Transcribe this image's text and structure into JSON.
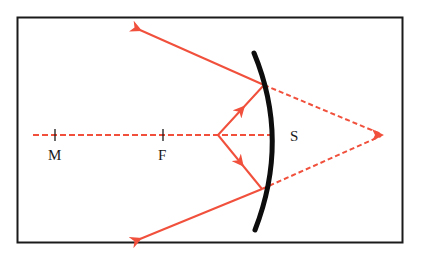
{
  "diagram": {
    "type": "convex-mirror-ray-diagram",
    "colors": {
      "frame": "#1a1a1a",
      "ray": "#f0503c",
      "mirror": "#0d0d0d",
      "label": "#1a1a1a",
      "background": "#ffffff"
    },
    "labels": {
      "M": "M",
      "F": "F",
      "S": "S"
    },
    "points": {
      "M": {
        "x": 55,
        "y": 135
      },
      "F": {
        "x": 163,
        "y": 135
      },
      "source": {
        "x": 218,
        "y": 135
      },
      "upper_incidence": {
        "x": 264,
        "y": 85
      },
      "lower_incidence": {
        "x": 262,
        "y": 189
      },
      "virtual_image": {
        "x": 383,
        "y": 135
      }
    },
    "rays": [
      {
        "name": "incident-upper",
        "style": "solid",
        "from": "source",
        "to": "upper_incidence"
      },
      {
        "name": "incident-lower",
        "style": "solid",
        "from": "source",
        "to": "lower_incidence"
      },
      {
        "name": "reflected-upper",
        "style": "solid",
        "from": "upper_incidence",
        "to_xy": [
          138,
          29
        ]
      },
      {
        "name": "reflected-lower",
        "style": "solid",
        "from": "lower_incidence",
        "to_xy": [
          138,
          240
        ]
      },
      {
        "name": "extension-upper",
        "style": "dashed",
        "from": "upper_incidence",
        "to": "virtual_image"
      },
      {
        "name": "extension-lower",
        "style": "dashed",
        "from": "lower_incidence",
        "to": "virtual_image"
      },
      {
        "name": "optical-axis",
        "style": "dashed",
        "from_xy": [
          33,
          135
        ],
        "to_xy": [
          271,
          135
        ]
      }
    ]
  }
}
